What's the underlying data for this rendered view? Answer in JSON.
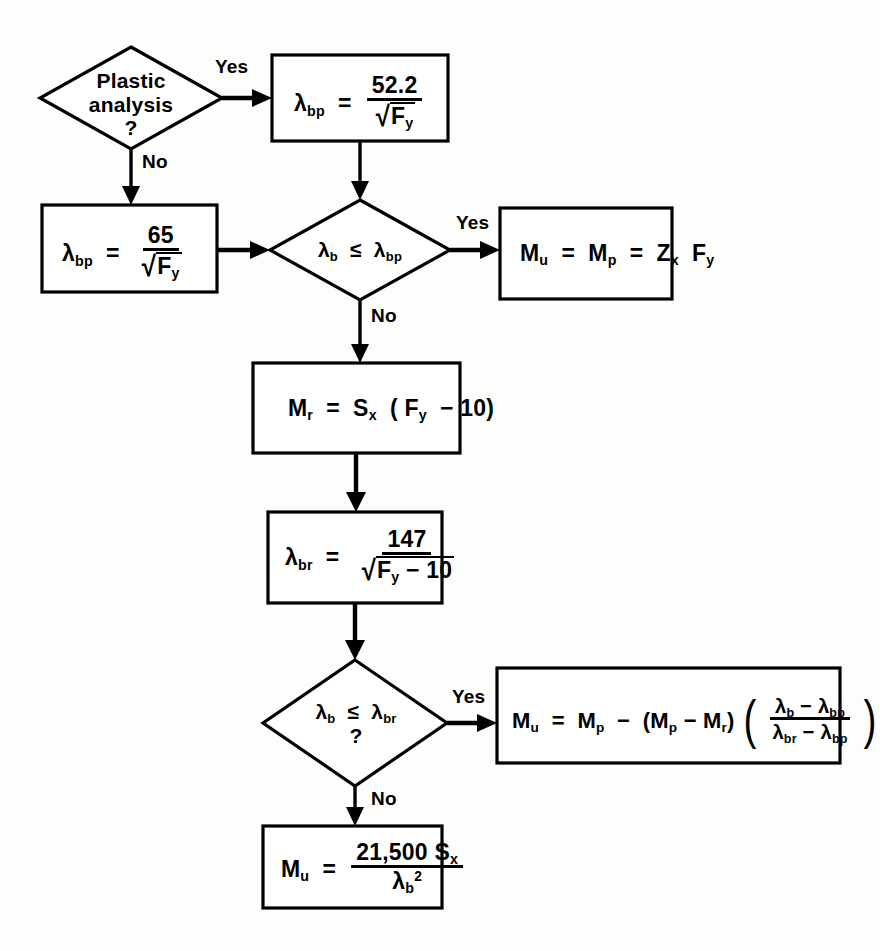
{
  "diagram": {
    "background_color": "#fdfdfb",
    "line_color": "#000000",
    "nodes": {
      "decision_plastic": {
        "type": "decision",
        "line1": "Plastic",
        "line2": "analysis",
        "line3": "?"
      },
      "box_lbp_522": {
        "type": "process",
        "lhs": "λ",
        "lhs_sub": "bp",
        "eq": "=",
        "numerator": "52.2",
        "denominator_radicand": "F",
        "denominator_radicand_sub": "y"
      },
      "box_lbp_65": {
        "type": "process",
        "lhs": "λ",
        "lhs_sub": "bp",
        "eq": "=",
        "numerator": "65",
        "denominator_radicand": "F",
        "denominator_radicand_sub": "y"
      },
      "decision_lb_lbp": {
        "type": "decision",
        "lhs": "λ",
        "lhs_sub": "b",
        "op": "≤",
        "rhs": "λ",
        "rhs_sub": "bp"
      },
      "box_mu_mp_zxfy": {
        "type": "process",
        "text": "M_u = M_p = Z_x F_y"
      },
      "box_mr": {
        "type": "process",
        "text": "M_r = S_x (F_y − 10)"
      },
      "box_lbr_147": {
        "type": "process",
        "lhs": "λ",
        "lhs_sub": "br",
        "eq": "=",
        "numerator": "147",
        "denominator": "√(F_y − 10)"
      },
      "decision_lb_lbr": {
        "type": "decision",
        "lhs": "λ",
        "lhs_sub": "b",
        "op": "≤",
        "rhs": "λ",
        "rhs_sub": "br",
        "question_mark": "?"
      },
      "box_mu_interp": {
        "type": "process",
        "text": "M_u = M_p − (M_p − M_r)((λ_b − λ_bp)/(λ_br − λ_bp))"
      },
      "box_mu_elastic": {
        "type": "process",
        "lhs": "M",
        "lhs_sub": "u",
        "eq": "=",
        "numerator": "21,500 S_x",
        "denominator": "λ_b^2"
      }
    },
    "labels": {
      "yes_top": "Yes",
      "no_top": "No",
      "yes_mid": "Yes",
      "no_mid": "No",
      "yes_bottom": "Yes",
      "no_bottom": "No"
    },
    "symbols": {
      "lambda": "λ",
      "less_equal": "≤",
      "minus": "−",
      "sqrt": "√",
      "equals": "=",
      "question": "?",
      "paren_open": "(",
      "paren_close": ")",
      "sub_bp": "bp",
      "sub_br": "br",
      "sub_b": "b",
      "sub_u": "u",
      "sub_p": "p",
      "sub_r": "r",
      "sub_x": "x",
      "sub_y": "y",
      "num_522": "52.2",
      "num_65": "65",
      "num_147": "147",
      "num_10": "10",
      "num_21500": "21,500",
      "sup_2": "2",
      "F": "F",
      "M": "M",
      "S": "S",
      "Z": "Z"
    }
  }
}
